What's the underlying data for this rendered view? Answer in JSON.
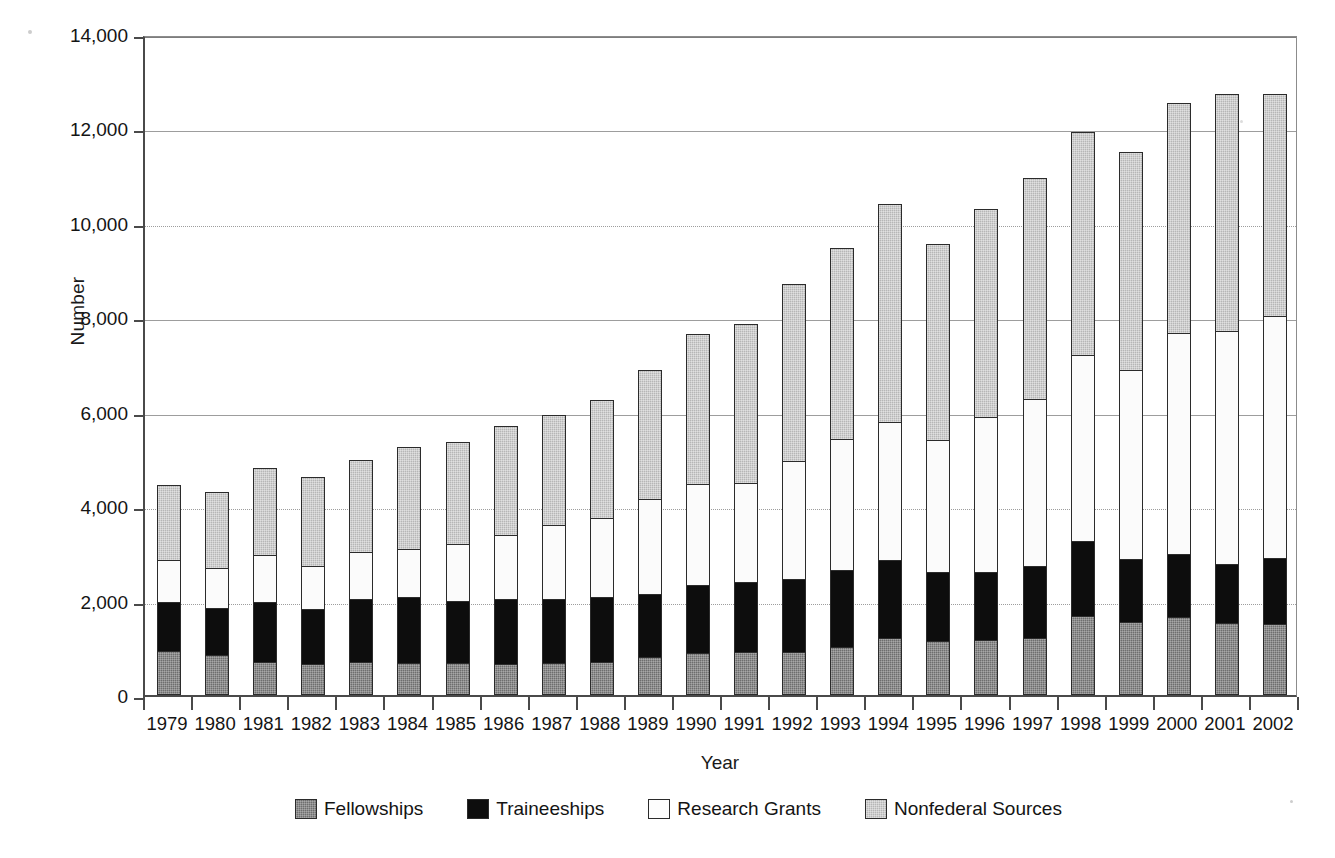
{
  "chart_data": {
    "type": "bar",
    "subtype": "stacked-vertical",
    "title": "",
    "xlabel": "Year",
    "ylabel": "Number",
    "ylim": [
      0,
      14000
    ],
    "ytick_step": 2000,
    "ytick_labels": [
      "14,000",
      "12,000",
      "10,000",
      "8,000",
      "6,000",
      "4,000",
      "2,000",
      "0"
    ],
    "ytick_values": [
      14000,
      12000,
      10000,
      8000,
      6000,
      4000,
      2000,
      0
    ],
    "grid": "horizontal",
    "legend_position": "bottom",
    "stack_order_bottom_to_top": [
      "Fellowships",
      "Traineeships",
      "Research Grants",
      "Nonfederal Sources"
    ],
    "categories": [
      "1979",
      "1980",
      "1981",
      "1982",
      "1983",
      "1984",
      "1985",
      "1986",
      "1987",
      "1988",
      "1989",
      "1990",
      "1991",
      "1992",
      "1993",
      "1994",
      "1995",
      "1996",
      "1997",
      "1998",
      "1999",
      "2000",
      "2001",
      "2002"
    ],
    "series": [
      {
        "name": "Fellowships",
        "color": "#6e6e6e",
        "values": [
          930,
          850,
          700,
          660,
          700,
          680,
          670,
          660,
          670,
          700,
          800,
          890,
          910,
          920,
          1010,
          1200,
          1140,
          1170,
          1200,
          1680,
          1540,
          1650,
          1530,
          1510
        ]
      },
      {
        "name": "Traineeships",
        "color": "#0d0d0d",
        "values": [
          1050,
          1000,
          1270,
          1170,
          1330,
          1390,
          1320,
          1370,
          1370,
          1380,
          1340,
          1430,
          1480,
          1530,
          1630,
          1670,
          1460,
          1440,
          1540,
          1590,
          1340,
          1340,
          1250,
          1390
        ]
      },
      {
        "name": "Research Grants",
        "color": "#fbfbfb",
        "values": [
          880,
          840,
          1000,
          900,
          990,
          1020,
          1200,
          1370,
          1560,
          1670,
          2010,
          2150,
          2110,
          2510,
          2780,
          2920,
          2800,
          3270,
          3520,
          3930,
          4000,
          4670,
          4930,
          5130
        ]
      },
      {
        "name": "Nonfederal Sources",
        "color": "#b6b6b6",
        "values": [
          1590,
          1610,
          1840,
          1880,
          1960,
          2160,
          2160,
          2300,
          2340,
          2500,
          2740,
          3180,
          3360,
          3740,
          4050,
          4600,
          4160,
          4420,
          4690,
          4720,
          4620,
          4870,
          5030,
          4710
        ]
      }
    ],
    "totals": [
      4450,
      4300,
      4810,
      4610,
      4980,
      5250,
      5350,
      5700,
      5940,
      6250,
      6890,
      7650,
      7860,
      8700,
      9470,
      10390,
      9560,
      10300,
      10950,
      11920,
      11500,
      12530,
      12740,
      12740
    ]
  },
  "legend": {
    "items": [
      {
        "label": "Fellowships",
        "swatch": "fellow"
      },
      {
        "label": "Traineeships",
        "swatch": "train"
      },
      {
        "label": "Research Grants",
        "swatch": "grant"
      },
      {
        "label": "Nonfederal Sources",
        "swatch": "nonfed"
      }
    ]
  }
}
